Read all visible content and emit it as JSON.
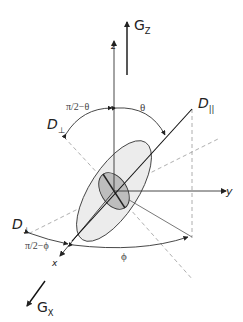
{
  "diagram": {
    "type": "diffusion tensor ellipsoid orientation diagram",
    "labels": {
      "gz": "G",
      "gz_sub": "Z",
      "gx": "G",
      "gx_sub": "X",
      "z_axis": "z",
      "y_axis": "y",
      "x_axis": "x",
      "d_parallel": "D",
      "d_parallel_sub": "||",
      "d_perp_top": "D",
      "d_perp_top_sub": "⊥",
      "d_perp_bottom": "D",
      "d_perp_bottom_sub": "⊥",
      "theta": "θ",
      "pi2_minus_theta": "π/2−θ",
      "phi": "ϕ",
      "pi2_minus_phi": "π/2−ϕ"
    },
    "colors": {
      "line": "#222222",
      "dashed": "#999999",
      "ellipse_fill": "#ececec",
      "inner_ellipse_fill": "#bdbdbd"
    }
  }
}
